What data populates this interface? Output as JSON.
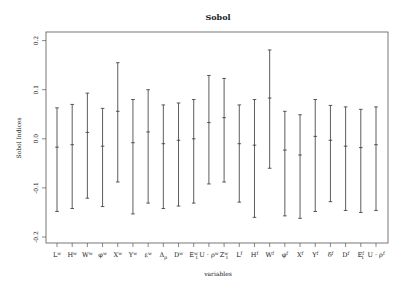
{
  "chart_data": {
    "type": "errorbar",
    "title": "Sobol",
    "xlabel": "variables",
    "ylabel": "Sobol Indices",
    "ylim": [
      -0.22,
      0.22
    ],
    "yticks": [
      -0.2,
      -0.1,
      0.0,
      0.1,
      0.2
    ],
    "ytick_labels": [
      "-0.2",
      "-0.1",
      "0.0",
      "0.1",
      "0.2"
    ],
    "grid": false,
    "legend": null,
    "categories": [
      {
        "base": "L",
        "sup": "w",
        "sub": ""
      },
      {
        "base": "H",
        "sup": "w",
        "sub": ""
      },
      {
        "base": "W",
        "sup": "w",
        "sub": ""
      },
      {
        "base": "φ",
        "sup": "w",
        "sub": ""
      },
      {
        "base": "X",
        "sup": "w",
        "sub": ""
      },
      {
        "base": "Y",
        "sup": "w",
        "sub": ""
      },
      {
        "base": "ε",
        "sup": "w",
        "sub": ""
      },
      {
        "base": "Δ",
        "sup": "",
        "sub": "ρ"
      },
      {
        "base": "D",
        "sup": "w",
        "sub": ""
      },
      {
        "base": "E",
        "sup": "w",
        "sub": "1"
      },
      {
        "base": "U · ρ",
        "sup": "w",
        "sub": ""
      },
      {
        "base": "Z",
        "sup": "w",
        "sub": "1"
      },
      {
        "base": "L",
        "sup": "f",
        "sub": ""
      },
      {
        "base": "H",
        "sup": "f",
        "sub": ""
      },
      {
        "base": "W",
        "sup": "f",
        "sub": ""
      },
      {
        "base": "φ",
        "sup": "f",
        "sub": ""
      },
      {
        "base": "X",
        "sup": "f",
        "sub": ""
      },
      {
        "base": "Y",
        "sup": "f",
        "sub": ""
      },
      {
        "base": "δ",
        "sup": "f",
        "sub": ""
      },
      {
        "base": "D",
        "sup": "f",
        "sub": ""
      },
      {
        "base": "E",
        "sup": "f",
        "sub": "1"
      },
      {
        "base": "U · ρ",
        "sup": "f",
        "sub": ""
      }
    ],
    "series": [
      {
        "name": "Sobol index (mean with interval)",
        "mean": [
          -0.017,
          -0.012,
          0.013,
          -0.015,
          0.056,
          -0.008,
          0.014,
          -0.01,
          -0.003,
          0.0,
          0.033,
          0.043,
          -0.01,
          -0.013,
          0.083,
          -0.023,
          -0.033,
          0.005,
          -0.003,
          -0.015,
          -0.018,
          -0.012
        ],
        "upper": [
          0.063,
          0.07,
          0.093,
          0.062,
          0.155,
          0.08,
          0.1,
          0.069,
          0.073,
          0.08,
          0.129,
          0.123,
          0.069,
          0.08,
          0.181,
          0.056,
          0.049,
          0.08,
          0.068,
          0.065,
          0.06,
          0.065
        ],
        "lower": [
          -0.148,
          -0.142,
          -0.121,
          -0.138,
          -0.088,
          -0.153,
          -0.131,
          -0.142,
          -0.137,
          -0.131,
          -0.092,
          -0.088,
          -0.129,
          -0.16,
          -0.06,
          -0.157,
          -0.162,
          -0.148,
          -0.128,
          -0.146,
          -0.15,
          -0.146
        ]
      }
    ]
  },
  "colors": {
    "frame": "#555555",
    "bars": "#333333",
    "text": "#222222",
    "background": "#ffffff"
  }
}
